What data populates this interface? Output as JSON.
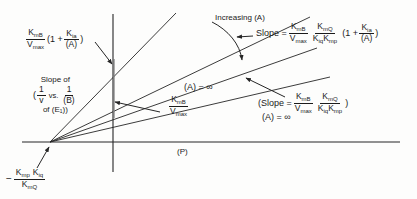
{
  "figure": {
    "type": "kinetics-double-reciprocal-plot",
    "axes": {
      "x_label": "(P)",
      "y_label": "",
      "origin_px": [
        113,
        142
      ],
      "x_axis_from_px": [
        22,
        142
      ],
      "x_axis_to_px": [
        400,
        142
      ],
      "y_axis_from_px": [
        113,
        14
      ],
      "y_axis_to_px": [
        113,
        172
      ]
    },
    "convergence_point_label": {
      "minus": "−",
      "numerator_k1": "K",
      "numerator_k1_sub": "mp",
      "numerator_k2": "K",
      "numerator_k2_sub": "iq",
      "denominator_k": "K",
      "denominator_k_sub": "mQ"
    },
    "lines": [
      {
        "name": "line-steepest",
        "from_px": [
          50,
          142
        ],
        "to_px": [
          176,
          13
        ]
      },
      {
        "name": "line-steep",
        "from_px": [
          50,
          142
        ],
        "to_px": [
          310,
          17
        ]
      },
      {
        "name": "line-medium",
        "from_px": [
          50,
          142
        ],
        "to_px": [
          317,
          48
        ]
      },
      {
        "name": "line-shallow-A-infinity",
        "from_px": [
          50,
          142
        ],
        "to_px": [
          330,
          77
        ]
      }
    ],
    "intercept_tick": {
      "name": "y-intercept-tick",
      "from_px": [
        113,
        59
      ],
      "to_px": [
        113,
        118
      ]
    }
  },
  "labels": {
    "y_intercept_top": {
      "name": "y-intercept-expression",
      "k": "K",
      "k_sub": "m",
      "k_sub2": "B",
      "v": "V",
      "v_sub": "max",
      "open": "(1 +",
      "kia": "K",
      "kia_sub": "ia",
      "a": "(A)",
      "close": ")"
    },
    "slope_of_block": {
      "name": "slope-of-annotation",
      "line1": "Slope of",
      "open_paren": "(",
      "one": "1",
      "v": "v",
      "vs": "vs.",
      "one2": "1",
      "b": "(B)",
      "line3": "of (E₁))"
    },
    "increasing_a": {
      "name": "increasing-a-annotation",
      "text": "Increasing (A)"
    },
    "slope_top_right": {
      "name": "slope-top-right-expression",
      "prefix": "Slope  =",
      "k1": "K",
      "k1_sub": "m",
      "k1_sub2": "B",
      "v": "V",
      "v_sub": "max",
      "k2": "K",
      "k2_sub": "m",
      "k2_sub2": "Q",
      "kiq": "K",
      "kiq_sub": "iq",
      "kmp": "K",
      "kmp_sub": "mp",
      "open": "(1 +",
      "kia": "K",
      "kia_sub": "ia",
      "a": "(A)",
      "close": ")"
    },
    "a_equals_infinity_left": {
      "name": "a-equals-infinity-left",
      "text": "(A) = ∞"
    },
    "km_vmax_center": {
      "name": "km-vmax-center-expression",
      "k": "K",
      "k_sub": "m",
      "k_sub2": "B",
      "v": "V",
      "v_sub": "max"
    },
    "slope_a_infinity_right": {
      "name": "slope-a-infinity-right-expression",
      "prefix": "(Slope  =",
      "k1": "K",
      "k1_sub": "m",
      "k1_sub2": "B",
      "v": "V",
      "v_sub": "max",
      "k2": "K",
      "k2_sub": "m",
      "k2_sub2": "Q",
      "kiq": "K",
      "kiq_sub": "iq",
      "kmp": "K",
      "kmp_sub": "mp",
      "close": ")",
      "below": "(A) = ∞"
    },
    "x_axis": {
      "name": "x-axis-label",
      "text": "(P)"
    }
  },
  "colors": {
    "stroke": "#262626",
    "background": "#fdfdfc",
    "text": "#1b1b1b"
  }
}
